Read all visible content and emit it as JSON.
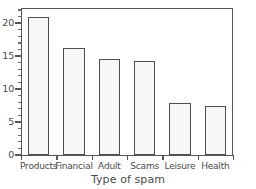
{
  "chart_data": {
    "type": "bar",
    "title": "",
    "xlabel": "Type of spam",
    "ylabel": "",
    "categories": [
      "Products",
      "Financial",
      "Adult",
      "Scams",
      "Leisure",
      "Health"
    ],
    "values": [
      21.0,
      16.2,
      14.5,
      14.2,
      7.9,
      7.4
    ],
    "ylim": [
      0,
      22.3
    ],
    "xlim": [
      0,
      6
    ],
    "y_major_ticks": [
      0,
      5,
      10,
      15,
      20
    ],
    "y_tick_labels": [
      "0",
      "5",
      "10",
      "15",
      "20"
    ],
    "y_minor_tick_interval": 1,
    "grid": false,
    "legend": null,
    "bar_fill_color": "#f7f7f7",
    "bar_edge_color": "#4f4f4f",
    "axis_color": "#565656",
    "text_color": "#4a4a4a",
    "background_color": "#ffffff",
    "frame": "left-top-right"
  }
}
